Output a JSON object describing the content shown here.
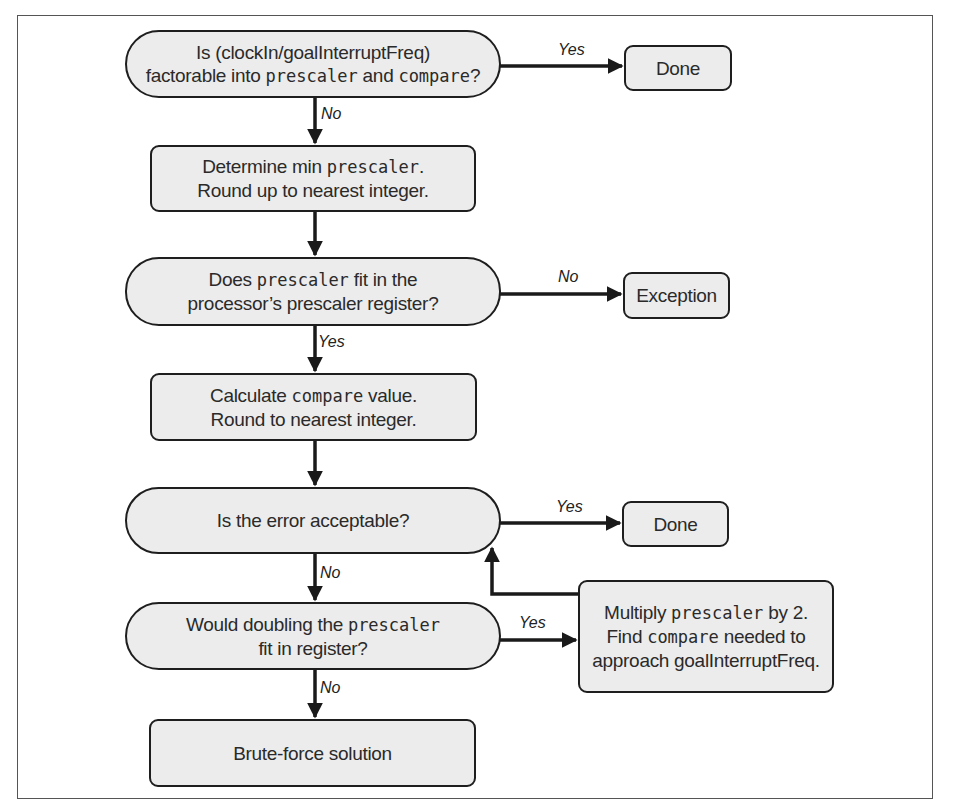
{
  "diagram": {
    "type": "flowchart",
    "nodes": {
      "d1": {
        "shape": "decision",
        "line1": "Is (clockIn/goalInterruptFreq)",
        "line2_a": "factorable into ",
        "line2_code1": "prescaler",
        "line2_b": " and ",
        "line2_code2": "compare",
        "line2_c": "?"
      },
      "done1": {
        "shape": "terminal",
        "text": "Done"
      },
      "p1": {
        "shape": "process",
        "line1_a": "Determine min ",
        "line1_code": "prescaler",
        "line1_b": ".",
        "line2": "Round up to nearest integer."
      },
      "d2": {
        "shape": "decision",
        "line1_a": "Does ",
        "line1_code": "prescaler",
        "line1_b": " fit in the",
        "line2": "processor’s prescaler register?"
      },
      "exception": {
        "shape": "terminal",
        "text": "Exception"
      },
      "p2": {
        "shape": "process",
        "line1_a": "Calculate ",
        "line1_code": "compare",
        "line1_b": " value.",
        "line2": "Round to nearest integer."
      },
      "d3": {
        "shape": "decision",
        "text": "Is the error acceptable?"
      },
      "done2": {
        "shape": "terminal",
        "text": "Done"
      },
      "d4": {
        "shape": "decision",
        "line1_a": "Would doubling the ",
        "line1_code": "prescaler",
        "line2": "fit in register?"
      },
      "p3": {
        "shape": "process",
        "line1_a": "Multiply ",
        "line1_code": "prescaler",
        "line1_b": " by 2.",
        "line2_a": "Find ",
        "line2_code": "compare",
        "line2_b": " needed to",
        "line3": "approach goalInterruptFreq."
      },
      "brute": {
        "shape": "process",
        "text": "Brute-force solution"
      }
    },
    "edges": [
      {
        "from": "d1",
        "to": "done1",
        "label": "Yes"
      },
      {
        "from": "d1",
        "to": "p1",
        "label": "No"
      },
      {
        "from": "p1",
        "to": "d2",
        "label": ""
      },
      {
        "from": "d2",
        "to": "exception",
        "label": "No"
      },
      {
        "from": "d2",
        "to": "p2",
        "label": "Yes"
      },
      {
        "from": "p2",
        "to": "d3",
        "label": ""
      },
      {
        "from": "d3",
        "to": "done2",
        "label": "Yes"
      },
      {
        "from": "d3",
        "to": "d4",
        "label": "No"
      },
      {
        "from": "d4",
        "to": "p3",
        "label": "Yes"
      },
      {
        "from": "p3",
        "to": "d3",
        "label": ""
      },
      {
        "from": "d4",
        "to": "brute",
        "label": "No"
      }
    ],
    "labels": {
      "yes": "Yes",
      "no": "No"
    },
    "colors": {
      "node_fill": "#ececec",
      "stroke": "#1e1e1e",
      "frame": "#555555"
    }
  }
}
